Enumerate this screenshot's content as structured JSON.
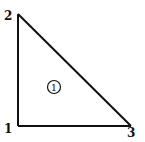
{
  "diagram": {
    "type": "finite-element-triangle",
    "stroke_color": "#111111",
    "background": "#ffffff",
    "nodes": [
      {
        "id": "1",
        "label": "1",
        "x": 18,
        "y": 126,
        "label_x": 4,
        "label_y": 133
      },
      {
        "id": "2",
        "label": "2",
        "x": 18,
        "y": 14,
        "label_x": 4,
        "label_y": 20
      },
      {
        "id": "3",
        "label": "3",
        "x": 131,
        "y": 126,
        "label_x": 127,
        "label_y": 137
      }
    ],
    "edges": [
      {
        "from": "1",
        "to": "2"
      },
      {
        "from": "2",
        "to": "3"
      },
      {
        "from": "1",
        "to": "3"
      }
    ],
    "element": {
      "label": "1",
      "cx": 54,
      "cy": 87,
      "r": 6.5
    }
  }
}
